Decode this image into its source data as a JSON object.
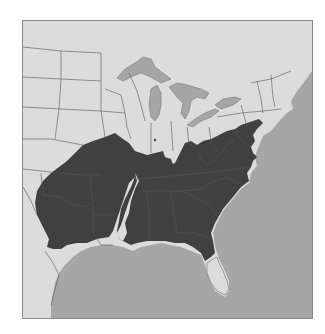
{
  "map": {
    "title": "",
    "region": "Eastern United States",
    "colors": {
      "land": "#dcdcdc",
      "water": "#a6a6a6",
      "range": "#404040",
      "border": "#555555",
      "frame_border": "#8a8a8a"
    },
    "layers": [
      {
        "name": "ocean",
        "label": "Atlantic Ocean / Gulf of Mexico"
      },
      {
        "name": "great-lakes",
        "label": "Great Lakes"
      },
      {
        "name": "range",
        "label": "Distribution range (shaded)"
      },
      {
        "name": "state-borders",
        "label": "State borders"
      }
    ]
  }
}
